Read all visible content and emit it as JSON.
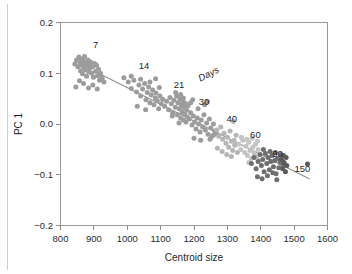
{
  "figure": {
    "background": "#ffffff",
    "left_edge_rule_color": "#cfcfcf"
  },
  "chart_data": {
    "type": "scatter",
    "title": "",
    "xlabel": "Centroid size",
    "ylabel": "PC 1",
    "xlim": [
      800,
      1600
    ],
    "ylim": [
      -0.2,
      0.2
    ],
    "xticks": [
      800,
      900,
      1000,
      1100,
      1200,
      1300,
      1400,
      1500,
      1600
    ],
    "xticklabels": [
      "800",
      "900",
      "1000",
      "1100",
      "1200",
      "1300",
      "1400",
      "1500",
      "1600"
    ],
    "yticks": [
      -0.2,
      -0.1,
      0.0,
      0.1,
      0.2
    ],
    "yticklabels": [
      "−0.2",
      "−0.1",
      "0.0",
      "0.1",
      "0.2"
    ],
    "grid": false,
    "legend": "none",
    "legend_position": "inline-annotations",
    "annotations": [
      {
        "text": "7",
        "x": 905,
        "y": 0.15,
        "rotation": 0,
        "italic": false
      },
      {
        "text": "14",
        "x": 1050,
        "y": 0.108,
        "rotation": 0,
        "italic": false
      },
      {
        "text": "21",
        "x": 1155,
        "y": 0.07,
        "rotation": 0,
        "italic": false
      },
      {
        "text": "Days",
        "x": 1248,
        "y": 0.093,
        "rotation": -27,
        "italic": true
      },
      {
        "text": "30",
        "x": 1230,
        "y": 0.037,
        "rotation": 0,
        "italic": false
      },
      {
        "text": "40",
        "x": 1313,
        "y": 0.003,
        "rotation": 0,
        "italic": false
      },
      {
        "text": "60",
        "x": 1384,
        "y": -0.027,
        "rotation": 0,
        "italic": false
      },
      {
        "text": "90",
        "x": 1450,
        "y": -0.066,
        "rotation": 0,
        "italic": false
      },
      {
        "text": "150",
        "x": 1525,
        "y": -0.094,
        "rotation": 0,
        "italic": false
      }
    ],
    "trendline": {
      "x": [
        905,
        1545
      ],
      "y": [
        0.103,
        -0.108
      ],
      "color": "#8f8f8f"
    },
    "series": [
      {
        "name": "7",
        "color": "#9c9c9c",
        "points": [
          [
            843,
            0.118
          ],
          [
            848,
            0.126
          ],
          [
            852,
            0.113
          ],
          [
            855,
            0.132
          ],
          [
            858,
            0.121
          ],
          [
            860,
            0.105
          ],
          [
            862,
            0.128
          ],
          [
            864,
            0.116
          ],
          [
            866,
            0.099
          ],
          [
            868,
            0.124
          ],
          [
            870,
            0.112
          ],
          [
            872,
            0.133
          ],
          [
            874,
            0.107
          ],
          [
            876,
            0.12
          ],
          [
            878,
            0.094
          ],
          [
            880,
            0.115
          ],
          [
            882,
            0.126
          ],
          [
            884,
            0.103
          ],
          [
            886,
            0.118
          ],
          [
            888,
            0.11
          ],
          [
            890,
            0.122
          ],
          [
            893,
            0.1
          ],
          [
            896,
            0.113
          ],
          [
            899,
            0.092
          ],
          [
            902,
            0.119
          ],
          [
            905,
            0.104
          ],
          [
            908,
            0.116
          ],
          [
            911,
            0.095
          ],
          [
            914,
            0.108
          ],
          [
            917,
            0.086
          ],
          [
            920,
            0.1
          ],
          [
            846,
            0.073
          ],
          [
            857,
            0.085
          ],
          [
            869,
            0.08
          ],
          [
            884,
            0.071
          ],
          [
            897,
            0.077
          ],
          [
            910,
            0.069
          ],
          [
            918,
            0.097
          ],
          [
            925,
            0.09
          ],
          [
            930,
            0.083
          ]
        ]
      },
      {
        "name": "14",
        "color": "#9c9c9c",
        "points": [
          [
            990,
            0.091
          ],
          [
            1003,
            0.083
          ],
          [
            1012,
            0.07
          ],
          [
            1020,
            0.086
          ],
          [
            1028,
            0.063
          ],
          [
            1035,
            0.077
          ],
          [
            1040,
            0.055
          ],
          [
            1046,
            0.069
          ],
          [
            1052,
            0.08
          ],
          [
            1056,
            0.048
          ],
          [
            1060,
            0.062
          ],
          [
            1064,
            0.073
          ],
          [
            1068,
            0.042
          ],
          [
            1072,
            0.057
          ],
          [
            1076,
            0.067
          ],
          [
            1080,
            0.038
          ],
          [
            1084,
            0.051
          ],
          [
            1086,
            0.061
          ],
          [
            1090,
            0.046
          ],
          [
            1094,
            0.03
          ],
          [
            1098,
            0.055
          ],
          [
            1102,
            0.04
          ],
          [
            1106,
            0.049
          ],
          [
            1012,
            0.094
          ],
          [
            1040,
            0.088
          ],
          [
            1068,
            0.083
          ],
          [
            1085,
            0.089
          ],
          [
            1096,
            0.072
          ],
          [
            1030,
            0.035
          ],
          [
            1055,
            0.028
          ]
        ]
      },
      {
        "name": "21",
        "color": "#9c9c9c",
        "points": [
          [
            1112,
            0.035
          ],
          [
            1118,
            0.045
          ],
          [
            1124,
            0.028
          ],
          [
            1128,
            0.052
          ],
          [
            1132,
            0.04
          ],
          [
            1136,
            0.022
          ],
          [
            1140,
            0.047
          ],
          [
            1144,
            0.033
          ],
          [
            1148,
            0.055
          ],
          [
            1150,
            0.018
          ],
          [
            1152,
            0.042
          ],
          [
            1156,
            0.03
          ],
          [
            1158,
            0.05
          ],
          [
            1160,
            0.012
          ],
          [
            1162,
            0.038
          ],
          [
            1164,
            0.024
          ],
          [
            1166,
            0.046
          ],
          [
            1168,
            0.008
          ],
          [
            1170,
            0.033
          ],
          [
            1172,
            0.019
          ],
          [
            1174,
            0.041
          ],
          [
            1176,
            0.004
          ],
          [
            1178,
            0.027
          ],
          [
            1180,
            0.014
          ],
          [
            1182,
            0.036
          ],
          [
            1145,
            0.062
          ],
          [
            1160,
            0.058
          ],
          [
            1168,
            0.051
          ],
          [
            1135,
            0.016
          ],
          [
            1155,
            0.002
          ]
        ]
      },
      {
        "name": "30",
        "color": "#9c9c9c",
        "points": [
          [
            1186,
            0.01
          ],
          [
            1190,
            0.022
          ],
          [
            1194,
            -0.002
          ],
          [
            1198,
            0.016
          ],
          [
            1202,
            0.004
          ],
          [
            1206,
            -0.01
          ],
          [
            1210,
            0.012
          ],
          [
            1214,
            0.0
          ],
          [
            1218,
            -0.016
          ],
          [
            1222,
            0.008
          ],
          [
            1226,
            -0.006
          ],
          [
            1230,
            0.018
          ],
          [
            1234,
            -0.012
          ],
          [
            1238,
            0.002
          ],
          [
            1242,
            -0.02
          ],
          [
            1246,
            0.01
          ],
          [
            1250,
            -0.008
          ],
          [
            1254,
            -0.024
          ],
          [
            1258,
            0.0
          ],
          [
            1262,
            -0.014
          ],
          [
            1190,
            0.042
          ],
          [
            1196,
            0.048
          ],
          [
            1212,
            0.03
          ],
          [
            1232,
            0.038
          ],
          [
            1240,
            0.044
          ],
          [
            1200,
            -0.028
          ],
          [
            1220,
            -0.032
          ],
          [
            1248,
            -0.03
          ],
          [
            1258,
            -0.022
          ],
          [
            1266,
            -0.018
          ]
        ]
      },
      {
        "name": "40",
        "color": "#b5b5b5",
        "points": [
          [
            1268,
            -0.012
          ],
          [
            1274,
            -0.024
          ],
          [
            1280,
            -0.006
          ],
          [
            1286,
            -0.03
          ],
          [
            1290,
            -0.018
          ],
          [
            1296,
            -0.038
          ],
          [
            1300,
            -0.026
          ],
          [
            1304,
            -0.046
          ],
          [
            1308,
            -0.014
          ],
          [
            1312,
            -0.034
          ],
          [
            1316,
            -0.052
          ],
          [
            1318,
            0.005
          ],
          [
            1322,
            -0.042
          ],
          [
            1326,
            -0.022
          ],
          [
            1330,
            -0.056
          ],
          [
            1270,
            -0.048
          ],
          [
            1284,
            -0.054
          ],
          [
            1298,
            -0.06
          ],
          [
            1312,
            -0.064
          ],
          [
            1320,
            -0.032
          ]
        ]
      },
      {
        "name": "60",
        "color": "#c4c4c4",
        "points": [
          [
            1334,
            -0.04
          ],
          [
            1340,
            -0.05
          ],
          [
            1346,
            -0.032
          ],
          [
            1352,
            -0.056
          ],
          [
            1356,
            -0.044
          ],
          [
            1360,
            -0.062
          ],
          [
            1364,
            -0.036
          ],
          [
            1368,
            -0.052
          ],
          [
            1372,
            -0.068
          ],
          [
            1376,
            -0.046
          ],
          [
            1380,
            -0.058
          ],
          [
            1384,
            -0.04
          ],
          [
            1388,
            -0.064
          ],
          [
            1392,
            -0.05
          ],
          [
            1396,
            -0.072
          ],
          [
            1342,
            -0.026
          ],
          [
            1358,
            -0.03
          ],
          [
            1374,
            -0.028
          ],
          [
            1390,
            -0.034
          ],
          [
            1364,
            -0.076
          ]
        ]
      },
      {
        "name": "90",
        "color": "#6e6e6e",
        "points": [
          [
            1372,
            -0.078
          ],
          [
            1380,
            -0.066
          ],
          [
            1386,
            -0.088
          ],
          [
            1392,
            -0.074
          ],
          [
            1398,
            -0.06
          ],
          [
            1402,
            -0.082
          ],
          [
            1406,
            -0.07
          ],
          [
            1410,
            -0.094
          ],
          [
            1414,
            -0.058
          ],
          [
            1418,
            -0.078
          ],
          [
            1422,
            -0.066
          ],
          [
            1426,
            -0.09
          ],
          [
            1430,
            -0.074
          ],
          [
            1434,
            -0.062
          ],
          [
            1438,
            -0.084
          ],
          [
            1442,
            -0.072
          ],
          [
            1446,
            -0.098
          ],
          [
            1450,
            -0.068
          ],
          [
            1454,
            -0.086
          ],
          [
            1458,
            -0.076
          ],
          [
            1390,
            -0.104
          ],
          [
            1404,
            -0.108
          ],
          [
            1420,
            -0.102
          ],
          [
            1436,
            -0.096
          ],
          [
            1448,
            -0.11
          ],
          [
            1408,
            -0.05
          ],
          [
            1428,
            -0.054
          ],
          [
            1444,
            -0.056
          ],
          [
            1460,
            -0.06
          ],
          [
            1466,
            -0.08
          ]
        ]
      },
      {
        "name": "150",
        "color": "#5a5a5a",
        "points": [
          [
            1462,
            -0.07
          ],
          [
            1466,
            -0.088
          ],
          [
            1470,
            -0.076
          ],
          [
            1474,
            -0.094
          ],
          [
            1478,
            -0.082
          ],
          [
            1468,
            -0.062
          ],
          [
            1476,
            -0.066
          ],
          [
            1540,
            -0.079
          ]
        ]
      }
    ]
  }
}
